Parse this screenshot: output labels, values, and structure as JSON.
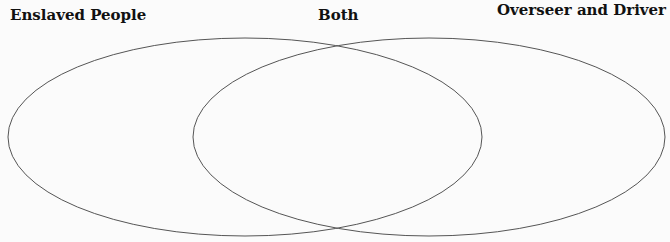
{
  "diagram": {
    "type": "venn",
    "sets": [
      {
        "id": "left",
        "label": "Enslaved People"
      },
      {
        "id": "right",
        "label": "Overseer and Driver"
      }
    ],
    "intersection_label": "Both",
    "stroke_color": "#555555",
    "background_color": "#fbfbfb"
  }
}
